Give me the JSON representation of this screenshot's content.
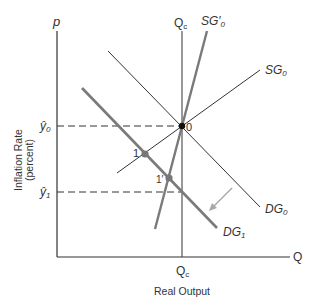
{
  "axes": {
    "y_axis_label": "p",
    "x_axis_label": "Q",
    "y_title_line1": "Inflation Rate",
    "y_title_line2": "(percent)",
    "x_title": "Real Output"
  },
  "ticks": {
    "y0_main": "ŷ",
    "y0_sub": "0",
    "y1_main": "ŷ",
    "y1_sub": "1",
    "qc_bottom_main": "Q",
    "qc_bottom_sub": "c",
    "qc_top_main": "Q",
    "qc_top_sub": "c"
  },
  "curves": {
    "sg0_main": "SG",
    "sg0_sub": "0",
    "sg0p_main": "SG′",
    "sg0p_sub": "0",
    "dg0_main": "DG",
    "dg0_sub": "0",
    "dg1_main": "DG",
    "dg1_sub": "1"
  },
  "points": {
    "p0": "0",
    "p1": "1",
    "p1prime": "1′"
  },
  "colors": {
    "thin_line": "#333333",
    "thick_line": "#7a7a7a",
    "arrow": "#a8a8a8",
    "point": "#777777"
  }
}
